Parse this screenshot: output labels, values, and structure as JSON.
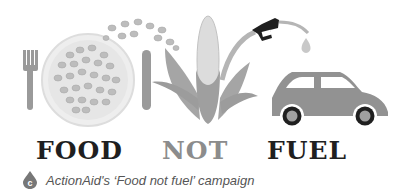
{
  "illustration": {
    "description": "Fork, plate of grains, knife, corn plant with fuel nozzle dripping into a car",
    "icons": [
      "fork-icon",
      "plate-icon",
      "grains-icon",
      "knife-icon",
      "corn-icon",
      "fuel-nozzle-icon",
      "fuel-drop-icon",
      "car-icon"
    ]
  },
  "slogan": {
    "word1": "FOOD",
    "word2": "NOT",
    "word3": "FUEL"
  },
  "caption": {
    "badge_letter": "c",
    "text": "ActionAid's ‘Food not fuel’ campaign"
  },
  "colors": {
    "dark": "#1f1f1f",
    "mid_gray": "#8c8c8c",
    "badge": "#777777"
  }
}
